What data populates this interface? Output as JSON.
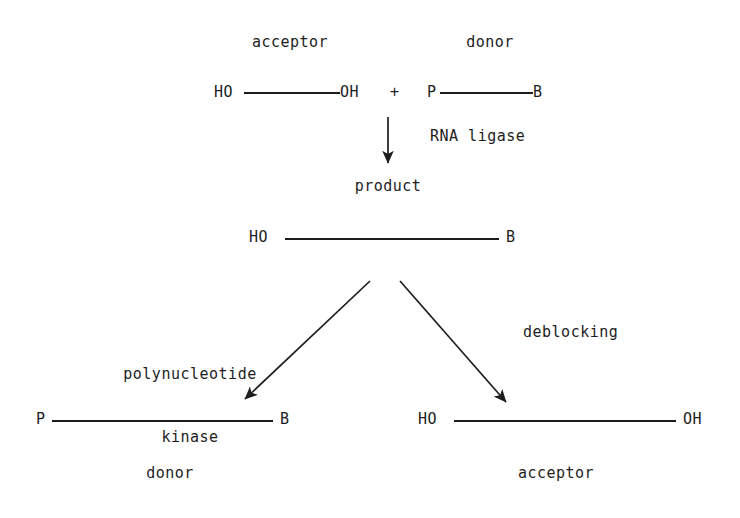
{
  "diagram": {
    "background_color": "#ffffff",
    "ink_color": "#1d1d1d",
    "reactants": {
      "acceptor_label": "acceptor",
      "donor_label": "donor",
      "acceptor_left_end": "HO",
      "acceptor_right_end": "OH",
      "plus_sign": "+",
      "donor_left_end": "P",
      "donor_right_end": "B"
    },
    "enzyme_step": {
      "enzyme_label": "RNA ligase",
      "product_label": "product",
      "product_left_end": "HO",
      "product_right_end": "B"
    },
    "branches": {
      "left": {
        "label_line1": "polynucleotide",
        "label_line2": "kinase",
        "result_left_end": "P",
        "result_right_end": "B",
        "result_label": "donor"
      },
      "right": {
        "label_line1": "deblocking",
        "label_line2": "",
        "result_left_end": "HO",
        "result_right_end": "OH",
        "result_label": "acceptor"
      }
    }
  }
}
